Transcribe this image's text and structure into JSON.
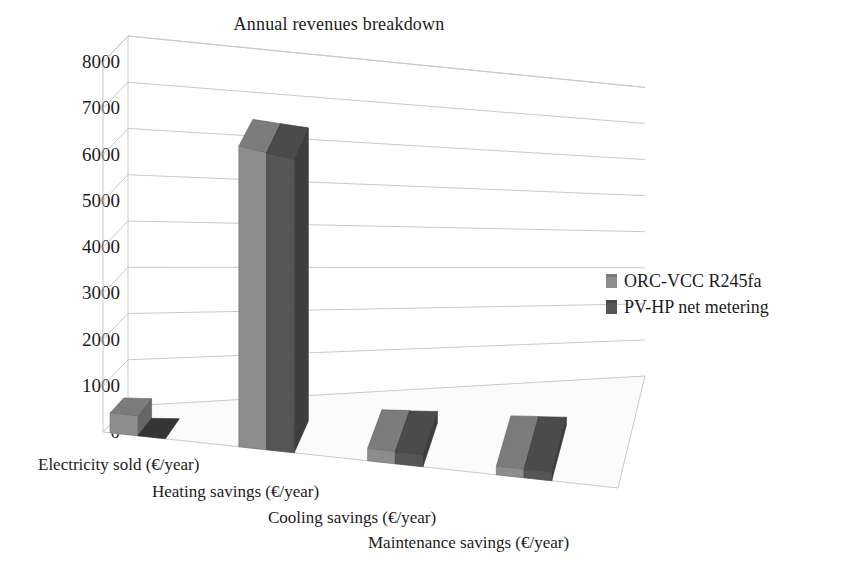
{
  "chart_data": {
    "type": "bar",
    "title": "Annual revenues breakdown",
    "xlabel": "",
    "ylabel": "",
    "ylim": [
      0,
      8000
    ],
    "ytick_step": 1000,
    "yticks": [
      "8000",
      "7000",
      "6000",
      "5000",
      "4000",
      "3000",
      "2000",
      "1000",
      "0"
    ],
    "grid": true,
    "three_d": true,
    "legend_position": "right",
    "categories": [
      "Electricity sold (€/year)",
      "Heating savings (€/year)",
      "Cooling savings (€/year)",
      "Maintenance savings (€/year)"
    ],
    "series": [
      {
        "name": "ORC-VCC R245fa",
        "color": "#8d8d8d",
        "values": [
          430,
          6900,
          300,
          220
        ]
      },
      {
        "name": "PV-HP net metering",
        "color": "#555555",
        "values": [
          0,
          6900,
          290,
          215
        ]
      }
    ]
  },
  "legend": {
    "items": [
      {
        "label": "ORC-VCC R245fa",
        "color": "#8d8d8d"
      },
      {
        "label": "PV-HP net metering",
        "color": "#555555"
      }
    ]
  },
  "colors": {
    "series_light": "#8d8d8d",
    "series_dark": "#555555",
    "gridline": "#c9c9c9",
    "floor": "#fbfbfb",
    "text": "#1c1c1c"
  }
}
